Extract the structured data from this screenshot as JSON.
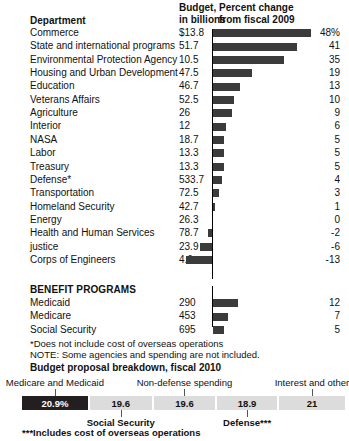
{
  "header": {
    "department_label": "Department",
    "budget_label_line1": "Budget,",
    "budget_label_line2": "in billions",
    "percent_label_line1": "Percent change",
    "percent_label_line2": "from fiscal 2009"
  },
  "section_benefit_label": "BENEFIT PROGRAMS",
  "footnotes": {
    "asterisk": "*Does not include cost of overseas operations",
    "note": "NOTE: Some agencies and spending are not included.",
    "triple_asterisk": "***Includes cost of overseas operations"
  },
  "breakdown": {
    "title": "Budget proposal breakdown, fiscal 2010",
    "segments": [
      {
        "label": "Medicare and Medicaid",
        "value": "20.9%",
        "pct": 20.9,
        "dark": true,
        "label_position": "top"
      },
      {
        "label": "Social Security",
        "value": "19.6",
        "pct": 19.6,
        "dark": false,
        "label_position": "bottom"
      },
      {
        "label": "Non-defense spending",
        "value": "19.6",
        "pct": 19.6,
        "dark": false,
        "label_position": "top"
      },
      {
        "label": "Defense***",
        "value": "18.9",
        "pct": 18.9,
        "dark": false,
        "label_position": "bottom"
      },
      {
        "label": "Interest and other",
        "value": "21",
        "pct": 21.0,
        "dark": false,
        "label_position": "top"
      }
    ]
  },
  "chart_data": {
    "type": "bar",
    "title": "Percent change from fiscal 2009",
    "xlabel": "Percent change from fiscal 2009",
    "ylabel": "Department",
    "grid": false,
    "legend": "none",
    "orientation": "horizontal",
    "xlim": [
      -13,
      48
    ],
    "columns": [
      "Department",
      "Budget, in billions",
      "Percent change from fiscal 2009"
    ],
    "rows": [
      {
        "category": "Commerce",
        "budget": "$13.8",
        "value": 48,
        "value_label": "48%"
      },
      {
        "category": "State and international programs",
        "budget": "51.7",
        "value": 41,
        "value_label": "41"
      },
      {
        "category": "Environmental Protection Agency",
        "budget": "10.5",
        "value": 35,
        "value_label": "35"
      },
      {
        "category": "Housing and Urban Development",
        "budget": "47.5",
        "value": 19,
        "value_label": "19"
      },
      {
        "category": "Education",
        "budget": "46.7",
        "value": 13,
        "value_label": "13"
      },
      {
        "category": "Veterans Affairs",
        "budget": "52.5",
        "value": 10,
        "value_label": "10"
      },
      {
        "category": "Agriculture",
        "budget": "26",
        "value": 9,
        "value_label": "9"
      },
      {
        "category": "Interior",
        "budget": "12",
        "value": 6,
        "value_label": "6"
      },
      {
        "category": "NASA",
        "budget": "18.7",
        "value": 5,
        "value_label": "5"
      },
      {
        "category": "Labor",
        "budget": "13.3",
        "value": 5,
        "value_label": "5"
      },
      {
        "category": "Treasury",
        "budget": "13.3",
        "value": 5,
        "value_label": "5"
      },
      {
        "category": "Defense*",
        "budget": "533.7",
        "value": 4,
        "value_label": "4"
      },
      {
        "category": "Transportation",
        "budget": "72.5",
        "value": 3,
        "value_label": "3"
      },
      {
        "category": "Homeland Security",
        "budget": "42.7",
        "value": 1,
        "value_label": "1"
      },
      {
        "category": "Energy",
        "budget": "26.3",
        "value": 0,
        "value_label": "0"
      },
      {
        "category": "Health and Human Services",
        "budget": "78.7",
        "value": -2,
        "value_label": "-2"
      },
      {
        "category": "justice",
        "budget": "23.9",
        "value": -6,
        "value_label": "-6"
      },
      {
        "category": "Corps of Engineers",
        "budget": "4.6",
        "value": -13,
        "value_label": "-13"
      }
    ],
    "benefit_rows": [
      {
        "category": "Medicaid",
        "budget": "290",
        "value": 12,
        "value_label": "12"
      },
      {
        "category": "Medicare",
        "budget": "453",
        "value": 7,
        "value_label": "7"
      },
      {
        "category": "Social Security",
        "budget": "695",
        "value": 5,
        "value_label": "5"
      }
    ]
  }
}
